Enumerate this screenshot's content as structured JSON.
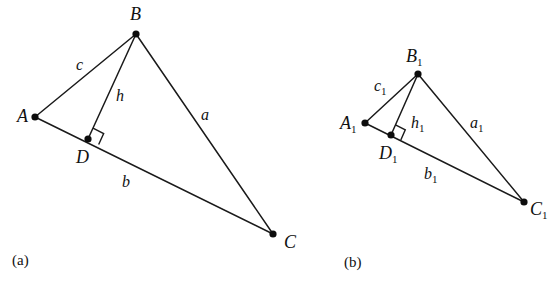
{
  "figure": {
    "background_color": "#ffffff",
    "line_color": "#1a1a1a",
    "point_color": "#0d0d0d",
    "width": 560,
    "height": 287
  },
  "panels": [
    {
      "id": "panel-a",
      "caption": "(a)",
      "caption_x": 12,
      "caption_y": 265,
      "vertices": [
        {
          "name": "A",
          "sub": "",
          "x": 35,
          "y": 117,
          "label_x": 17,
          "label_y": 122
        },
        {
          "name": "B",
          "sub": "",
          "x": 136,
          "y": 34,
          "label_x": 130,
          "label_y": 20
        },
        {
          "name": "C",
          "sub": "",
          "x": 273,
          "y": 234,
          "label_x": 284,
          "label_y": 248
        },
        {
          "name": "D",
          "sub": "",
          "x": 88,
          "y": 139,
          "label_x": 76,
          "label_y": 163
        }
      ],
      "segments": [
        {
          "name": "side-c",
          "from": "A",
          "to": "B",
          "label": "c",
          "sub": "",
          "label_x": 76,
          "label_y": 70
        },
        {
          "name": "side-a",
          "from": "B",
          "to": "C",
          "label": "a",
          "sub": "",
          "label_x": 201,
          "label_y": 120
        },
        {
          "name": "side-b",
          "from": "A",
          "to": "C",
          "label": "b",
          "sub": "",
          "label_x": 122,
          "label_y": 187
        },
        {
          "name": "altitude-h",
          "from": "B",
          "to": "D",
          "label": "h",
          "sub": "",
          "label_x": 116,
          "label_y": 101
        }
      ],
      "right_angle": {
        "at": "D",
        "size": 12
      }
    },
    {
      "id": "panel-b",
      "caption": "(b)",
      "caption_x": 344,
      "caption_y": 267,
      "vertices": [
        {
          "name": "A",
          "sub": "1",
          "x": 365,
          "y": 123,
          "label_x": 340,
          "label_y": 129
        },
        {
          "name": "B",
          "sub": "1",
          "x": 418,
          "y": 74,
          "label_x": 406,
          "label_y": 62
        },
        {
          "name": "C",
          "sub": "1",
          "x": 524,
          "y": 202,
          "label_x": 530,
          "label_y": 215
        },
        {
          "name": "D",
          "sub": "1",
          "x": 391,
          "y": 135,
          "label_x": 379,
          "label_y": 159
        }
      ],
      "segments": [
        {
          "name": "side-c1",
          "from": "A",
          "to": "B",
          "label": "c",
          "sub": "1",
          "label_x": 374,
          "label_y": 91
        },
        {
          "name": "side-a1",
          "from": "B",
          "to": "C",
          "label": "a",
          "sub": "1",
          "label_x": 470,
          "label_y": 128
        },
        {
          "name": "side-b1",
          "from": "A",
          "to": "C",
          "label": "b",
          "sub": "1",
          "label_x": 424,
          "label_y": 179
        },
        {
          "name": "altitude-h1",
          "from": "B",
          "to": "D",
          "label": "h",
          "sub": "1",
          "label_x": 411,
          "label_y": 128
        }
      ],
      "right_angle": {
        "at": "D",
        "size": 11
      }
    }
  ]
}
